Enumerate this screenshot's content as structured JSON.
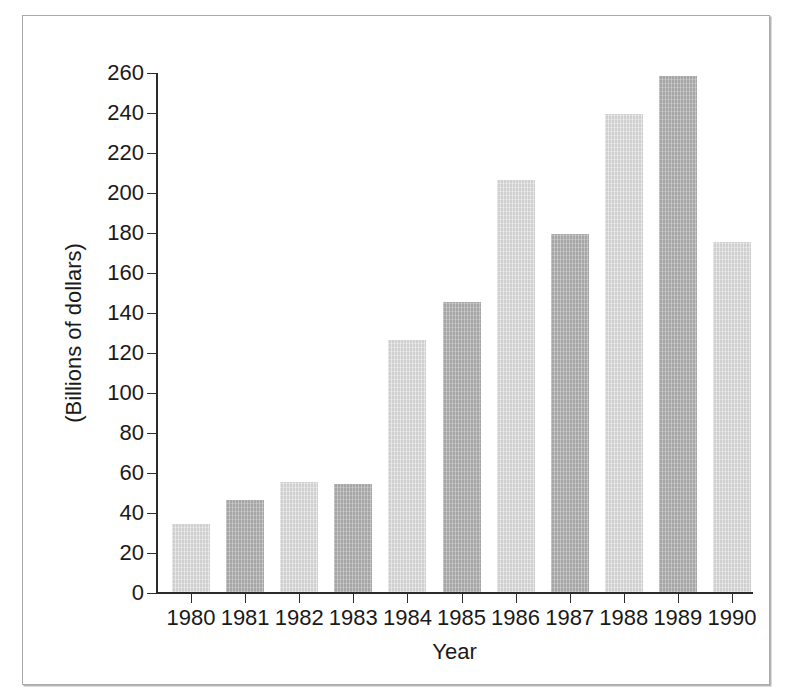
{
  "chart_data": {
    "type": "bar",
    "title": "",
    "subtitle": "",
    "xlabel": "Year",
    "ylabel": "(Billions of dollars)",
    "categories": [
      "1980",
      "1981",
      "1982",
      "1983",
      "1984",
      "1985",
      "1986",
      "1987",
      "1988",
      "1989",
      "1990"
    ],
    "values": [
      34,
      46,
      55,
      54,
      126,
      145,
      206,
      179,
      239,
      258,
      175
    ],
    "ylim": [
      0,
      260
    ],
    "ytick_step": 20,
    "yticks": [
      0,
      20,
      40,
      60,
      80,
      100,
      120,
      140,
      160,
      180,
      200,
      220,
      240,
      260
    ],
    "ytick_labels": [
      "0",
      "20",
      "40",
      "60",
      "80",
      "100",
      "120",
      "140",
      "160",
      "180",
      "200",
      "220",
      "240",
      "260"
    ],
    "grid": false,
    "legend": null,
    "annotations": [],
    "bar_colors": [
      "#cfcfcf",
      "#a6a6a6"
    ],
    "axis_color": "#2b2b2b",
    "frame_color": "#a9a9ab",
    "background": "#ffffff"
  }
}
